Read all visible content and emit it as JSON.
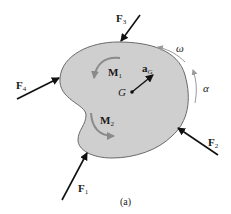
{
  "figure": {
    "caption": "(a)",
    "body_fill": "#cfcfcf",
    "body_stroke": "#6a6a6a",
    "arrow_color": "#111111",
    "moment_arrow_color": "#8a8a8a",
    "forces": [
      {
        "label": "F",
        "sub": "1"
      },
      {
        "label": "F",
        "sub": "2"
      },
      {
        "label": "F",
        "sub": "3"
      },
      {
        "label": "F",
        "sub": "4"
      }
    ],
    "moments": [
      {
        "label": "M",
        "sub": "1"
      },
      {
        "label": "M",
        "sub": "2"
      }
    ],
    "center": {
      "label": "G"
    },
    "acceleration": {
      "label": "a",
      "sub": "G"
    },
    "angular_velocity": {
      "label": "ω"
    },
    "angular_acceleration": {
      "label": "α"
    }
  }
}
